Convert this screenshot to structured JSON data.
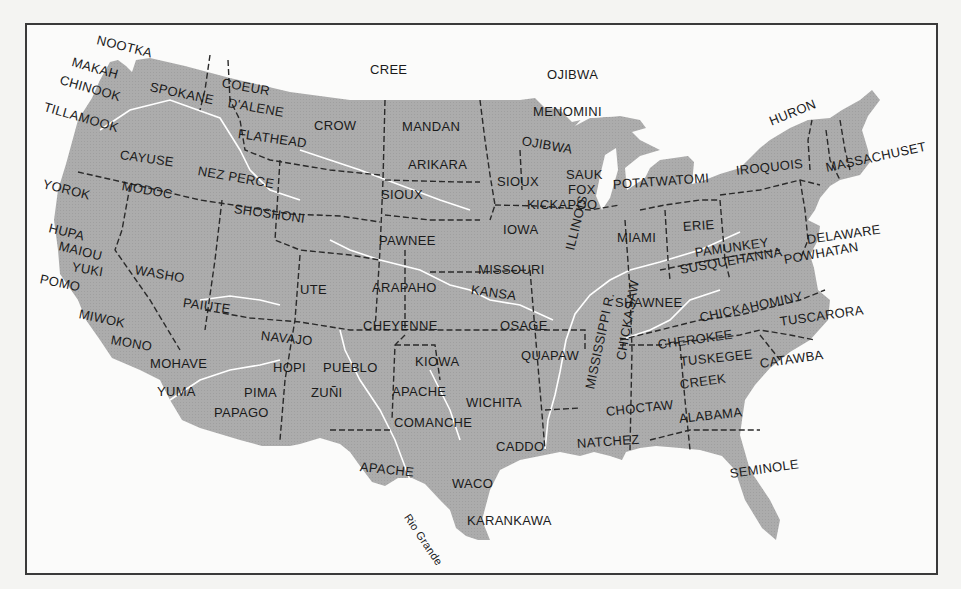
{
  "map": {
    "title": "Native American tribes of the United States",
    "land_color": "#ababab",
    "river_color": "#ffffff",
    "border_color": "#2a2a2a",
    "frame_color": "#3a3a3a",
    "labels": [
      {
        "text": "NOOTKA",
        "x": 97,
        "y": 40,
        "rot": 14
      },
      {
        "text": "MAKAH",
        "x": 72,
        "y": 62,
        "rot": 16
      },
      {
        "text": "CHINOOK",
        "x": 60,
        "y": 80,
        "rot": 16
      },
      {
        "text": "SPOKANE",
        "x": 150,
        "y": 87,
        "rot": 12
      },
      {
        "text": "COEUR",
        "x": 222,
        "y": 83,
        "rot": 10
      },
      {
        "text": "D'ALENE",
        "x": 228,
        "y": 103,
        "rot": 10
      },
      {
        "text": "TILLAMOOK",
        "x": 44,
        "y": 107,
        "rot": 16
      },
      {
        "text": "FLATHEAD",
        "x": 238,
        "y": 134,
        "rot": 8
      },
      {
        "text": "CREE",
        "x": 370,
        "y": 70,
        "rot": 0
      },
      {
        "text": "CROW",
        "x": 314,
        "y": 126,
        "rot": 0
      },
      {
        "text": "MANDAN",
        "x": 402,
        "y": 127,
        "rot": 0
      },
      {
        "text": "OJIBWA",
        "x": 547,
        "y": 75,
        "rot": 0
      },
      {
        "text": "MENOMINI",
        "x": 533,
        "y": 112,
        "rot": 0
      },
      {
        "text": "OJIBWA",
        "x": 522,
        "y": 141,
        "rot": 10
      },
      {
        "text": "ARIKARA",
        "x": 408,
        "y": 165,
        "rot": 0
      },
      {
        "text": "CAYUSE",
        "x": 120,
        "y": 155,
        "rot": 8
      },
      {
        "text": "NEZ PERCE",
        "x": 198,
        "y": 171,
        "rot": 10
      },
      {
        "text": "YOROK",
        "x": 43,
        "y": 184,
        "rot": 14
      },
      {
        "text": "MODOC",
        "x": 122,
        "y": 186,
        "rot": 10
      },
      {
        "text": "SHOSHONI",
        "x": 234,
        "y": 209,
        "rot": 8
      },
      {
        "text": "SIOUX",
        "x": 381,
        "y": 195,
        "rot": 0
      },
      {
        "text": "SIOUX",
        "x": 497,
        "y": 182,
        "rot": 0
      },
      {
        "text": "SAUK",
        "x": 566,
        "y": 175,
        "rot": 0
      },
      {
        "text": "FOX",
        "x": 568,
        "y": 190,
        "rot": 0
      },
      {
        "text": "KICKAPOO",
        "x": 527,
        "y": 205,
        "rot": 0
      },
      {
        "text": "POTATWATOMI",
        "x": 613,
        "y": 185,
        "rot": -4
      },
      {
        "text": "IROQUOIS",
        "x": 736,
        "y": 171,
        "rot": -6
      },
      {
        "text": "HURON",
        "x": 770,
        "y": 122,
        "rot": -22
      },
      {
        "text": "MASSACHUSET",
        "x": 826,
        "y": 168,
        "rot": -12
      },
      {
        "text": "HUPA",
        "x": 49,
        "y": 228,
        "rot": 14
      },
      {
        "text": "MAIOU",
        "x": 59,
        "y": 246,
        "rot": 14
      },
      {
        "text": "YUKI",
        "x": 72,
        "y": 267,
        "rot": 10
      },
      {
        "text": "POMO",
        "x": 40,
        "y": 279,
        "rot": 12
      },
      {
        "text": "WASHO",
        "x": 135,
        "y": 270,
        "rot": 10
      },
      {
        "text": "IOWA",
        "x": 503,
        "y": 230,
        "rot": 0
      },
      {
        "text": "PAWNEE",
        "x": 379,
        "y": 241,
        "rot": 0
      },
      {
        "text": "ILLINOIS",
        "x": 570,
        "y": 250,
        "rot": -76
      },
      {
        "text": "MIAMI",
        "x": 617,
        "y": 238,
        "rot": 0
      },
      {
        "text": "ERIE",
        "x": 683,
        "y": 227,
        "rot": -4
      },
      {
        "text": "PAMUNKEY",
        "x": 695,
        "y": 253,
        "rot": -8
      },
      {
        "text": "DELAWARE",
        "x": 807,
        "y": 240,
        "rot": -8
      },
      {
        "text": "SUSQUEHANNA",
        "x": 680,
        "y": 270,
        "rot": -10
      },
      {
        "text": "POWHATAN",
        "x": 784,
        "y": 260,
        "rot": -10
      },
      {
        "text": "MISSOURI",
        "x": 478,
        "y": 270,
        "rot": 0
      },
      {
        "text": "UTE",
        "x": 300,
        "y": 290,
        "rot": 0
      },
      {
        "text": "ARAPAHO",
        "x": 372,
        "y": 288,
        "rot": 0
      },
      {
        "text": "KANSA",
        "x": 471,
        "y": 290,
        "rot": 8
      },
      {
        "text": "PAIUTE",
        "x": 183,
        "y": 303,
        "rot": 8
      },
      {
        "text": "MIWOK",
        "x": 79,
        "y": 314,
        "rot": 12
      },
      {
        "text": "SHAWNEE",
        "x": 615,
        "y": 303,
        "rot": 0
      },
      {
        "text": "CHICKAHOMINY",
        "x": 700,
        "y": 318,
        "rot": -12
      },
      {
        "text": "CHEYENNE",
        "x": 363,
        "y": 326,
        "rot": 0
      },
      {
        "text": "OSAGE",
        "x": 500,
        "y": 326,
        "rot": 0
      },
      {
        "text": "MONO",
        "x": 111,
        "y": 340,
        "rot": 10
      },
      {
        "text": "NAVAJO",
        "x": 261,
        "y": 336,
        "rot": 6
      },
      {
        "text": "CHICKASAW",
        "x": 621,
        "y": 360,
        "rot": -80
      },
      {
        "text": "TUSCARORA",
        "x": 780,
        "y": 322,
        "rot": -8
      },
      {
        "text": "CHEROKEE",
        "x": 658,
        "y": 345,
        "rot": -8
      },
      {
        "text": "QUAPAW",
        "x": 521,
        "y": 356,
        "rot": 0
      },
      {
        "text": "MOHAVE",
        "x": 150,
        "y": 364,
        "rot": 0
      },
      {
        "text": "HOPI",
        "x": 273,
        "y": 368,
        "rot": 0
      },
      {
        "text": "PUEBLO",
        "x": 323,
        "y": 368,
        "rot": 0
      },
      {
        "text": "KIOWA",
        "x": 415,
        "y": 362,
        "rot": 0
      },
      {
        "text": "MISSISSIPPI R.",
        "x": 590,
        "y": 389,
        "rot": -78
      },
      {
        "text": "TUSKEGEE",
        "x": 680,
        "y": 362,
        "rot": -6
      },
      {
        "text": "CATAWBA",
        "x": 760,
        "y": 364,
        "rot": -8
      },
      {
        "text": "CREEK",
        "x": 680,
        "y": 385,
        "rot": -8
      },
      {
        "text": "YUMA",
        "x": 157,
        "y": 392,
        "rot": 0
      },
      {
        "text": "PIMA",
        "x": 244,
        "y": 393,
        "rot": 0
      },
      {
        "text": "ZUÑI",
        "x": 311,
        "y": 393,
        "rot": 0
      },
      {
        "text": "APACHE",
        "x": 392,
        "y": 392,
        "rot": 0
      },
      {
        "text": "WICHITA",
        "x": 466,
        "y": 403,
        "rot": 0
      },
      {
        "text": "CHOCTAW",
        "x": 606,
        "y": 412,
        "rot": -6
      },
      {
        "text": "ALABAMA",
        "x": 679,
        "y": 419,
        "rot": -6
      },
      {
        "text": "PAPAGO",
        "x": 214,
        "y": 413,
        "rot": 0
      },
      {
        "text": "COMANCHE",
        "x": 394,
        "y": 423,
        "rot": 0
      },
      {
        "text": "CADDO",
        "x": 496,
        "y": 447,
        "rot": 0
      },
      {
        "text": "NATCHEZ",
        "x": 577,
        "y": 444,
        "rot": -4
      },
      {
        "text": "SEMINOLE",
        "x": 730,
        "y": 474,
        "rot": -8
      },
      {
        "text": "APACHE",
        "x": 360,
        "y": 467,
        "rot": 6
      },
      {
        "text": "WACO",
        "x": 452,
        "y": 484,
        "rot": 0
      },
      {
        "text": "KARANKAWA",
        "x": 467,
        "y": 521,
        "rot": 0
      }
    ],
    "river_labels": [
      {
        "text": "Rio Grande",
        "x": 407,
        "y": 515,
        "rot": 56
      }
    ]
  }
}
